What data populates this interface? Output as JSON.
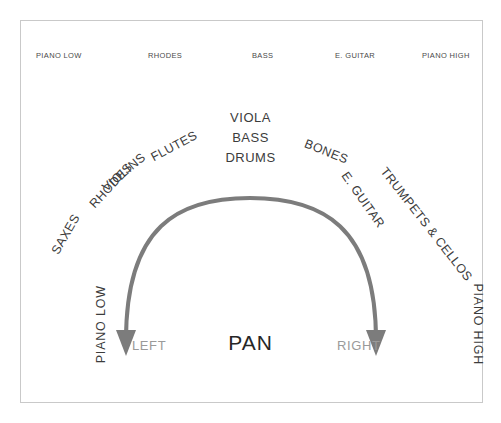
{
  "diagram": {
    "title": "PAN",
    "frame_color": "#c9c9c9",
    "arc_color": "#7c7c7c",
    "text_color": "#3c3c3c",
    "muted_text_color": "#9a9a9a",
    "background": "#ffffff"
  },
  "top_row": {
    "labels": [
      {
        "text": "PIANO LOW",
        "x": 36
      },
      {
        "text": "RHODES",
        "x": 148
      },
      {
        "text": "BASS",
        "x": 252
      },
      {
        "text": "E. GUITAR",
        "x": 335
      },
      {
        "text": "PIANO HIGH",
        "x": 422
      }
    ]
  },
  "fan_labels": {
    "left": [
      {
        "text": "SAXES",
        "x": 55,
        "y": 247,
        "rotate": -60
      },
      {
        "text": "RHODES",
        "x": 92,
        "y": 200,
        "rotate": -47
      },
      {
        "text": "VIOLINS",
        "x": 104,
        "y": 183,
        "rotate": -40
      },
      {
        "text": "FLUTES",
        "x": 152,
        "y": 152,
        "rotate": -28
      }
    ],
    "right": [
      {
        "text": "BONES",
        "x": 305,
        "y": 137,
        "rotate": 22
      },
      {
        "text": "E. GUITAR",
        "x": 344,
        "y": 167,
        "rotate": 55
      },
      {
        "text": "TRUMPETS & CELLOS",
        "x": 383,
        "y": 163,
        "rotate": 52
      }
    ]
  },
  "center_stack": {
    "lines": [
      "VIOLA",
      "BASS",
      "DRUMS"
    ]
  },
  "side_labels": {
    "left": {
      "text": "PIANO LOW",
      "x": 62,
      "y": 318
    },
    "right": {
      "text": "PIANO HIGH",
      "x": 437,
      "y": 318
    }
  },
  "bottom_row": {
    "left": {
      "text": "LEFT",
      "x": 132
    },
    "right": {
      "text": "RIGHT",
      "x": 337
    },
    "center": "PAN"
  },
  "arc": {
    "path": "M 126 352 C 126 232 180 196 250 196 C 320 196 376 232 376 352",
    "stroke_width": 4,
    "left_arrow": {
      "x": 126,
      "y": 352
    },
    "right_arrow": {
      "x": 376,
      "y": 352
    },
    "arrow_half_width": 9,
    "arrow_height": 20
  }
}
